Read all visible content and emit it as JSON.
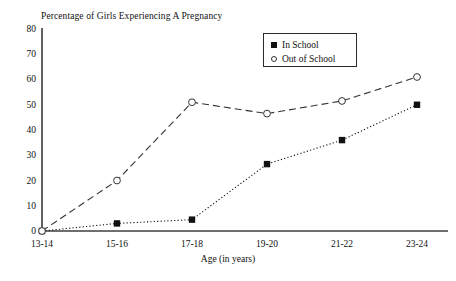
{
  "chart_data": {
    "type": "line",
    "title": "Percentage of Girls Experiencing A Pregnancy",
    "xlabel": "Age (in years)",
    "ylabel": "",
    "categories": [
      "13-14",
      "15-16",
      "17-18",
      "19-20",
      "21-22",
      "23-24"
    ],
    "ylim": [
      0,
      80
    ],
    "y_ticks": [
      0,
      10,
      20,
      30,
      40,
      50,
      60,
      70,
      80
    ],
    "grid": false,
    "legend_position": "top-right",
    "series": [
      {
        "name": "In School",
        "marker": "filled-square",
        "line_style": "dotted",
        "color": "#111111",
        "values": [
          0,
          3,
          4.5,
          26.5,
          36,
          50
        ]
      },
      {
        "name": "Out of School",
        "marker": "open-circle",
        "line_style": "dashed",
        "color": "#333333",
        "values": [
          0,
          20,
          51,
          46.5,
          51.5,
          61
        ]
      }
    ]
  },
  "axis": {
    "y_tick_labels": [
      "80",
      "70",
      "60",
      "50",
      "40",
      "30",
      "20",
      "10",
      "0"
    ],
    "x_tick_labels": [
      "13-14",
      "15-16",
      "17-18",
      "19-20",
      "21-22",
      "23-24"
    ],
    "x_title": "Age (in years)"
  },
  "legend": {
    "entries": [
      {
        "label": "In School"
      },
      {
        "label": "Out of School"
      }
    ]
  }
}
